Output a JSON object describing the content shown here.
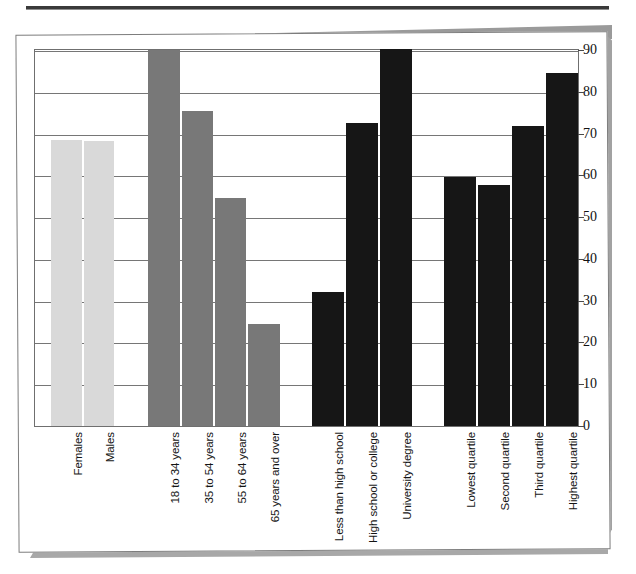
{
  "chart_data": {
    "type": "bar",
    "title": "",
    "subtitle": "",
    "xlabel": "",
    "ylabel": "",
    "ylim": [
      0,
      90
    ],
    "y_ticks": [
      0,
      10,
      20,
      30,
      40,
      50,
      60,
      70,
      80,
      90
    ],
    "grid": true,
    "legend": "none",
    "orientation": "vertical",
    "groups": [
      {
        "name": "Sex",
        "color": "#d9d9d9",
        "categories": [
          "Females",
          "Males"
        ],
        "values": [
          68.5,
          68.3
        ]
      },
      {
        "name": "Age group",
        "color": "#787878",
        "categories": [
          "18 to 34 years",
          "35 to 54 years",
          "55 to 64 years",
          "65 years and over"
        ],
        "values": [
          90.0,
          75.3,
          54.5,
          24.5
        ]
      },
      {
        "name": "Education",
        "color": "#161616",
        "categories": [
          "Less than high school",
          "High school or college",
          "University degree"
        ],
        "values": [
          32.0,
          72.5,
          90.3
        ]
      },
      {
        "name": "Income quartile",
        "color": "#161616",
        "categories": [
          "Lowest quartile",
          "Second quartile",
          "Third quartile",
          "Highest quartile"
        ],
        "values": [
          59.5,
          57.8,
          71.8,
          84.5
        ]
      }
    ],
    "categories": [
      "Females",
      "Males",
      "18 to 34 years",
      "35 to 54 years",
      "55 to 64 years",
      "65 years and over",
      "Less than high school",
      "High school or college",
      "University degree",
      "Lowest quartile",
      "Second quartile",
      "Third quartile",
      "Highest quartile"
    ],
    "values": [
      68.5,
      68.3,
      90.0,
      75.3,
      54.5,
      24.5,
      32.0,
      72.5,
      90.3,
      59.5,
      57.8,
      71.8,
      84.5
    ]
  },
  "bars": [
    {
      "label": "Females",
      "value": 68.5,
      "color": "#d9d9d9",
      "x": 17,
      "w": 31
    },
    {
      "label": "Males",
      "value": 68.3,
      "color": "#d9d9d9",
      "x": 50,
      "w": 30
    },
    {
      "label": "18 to 34 years",
      "value": 90.0,
      "color": "#787878",
      "x": 114,
      "w": 32
    },
    {
      "label": "35 to 54 years",
      "value": 75.3,
      "color": "#787878",
      "x": 148,
      "w": 31
    },
    {
      "label": "55 to 64 years",
      "value": 54.5,
      "color": "#787878",
      "x": 181,
      "w": 31
    },
    {
      "label": "65 years and over",
      "value": 24.5,
      "color": "#787878",
      "x": 214,
      "w": 32
    },
    {
      "label": "Less than high school",
      "value": 32.0,
      "color": "#161616",
      "x": 278,
      "w": 32
    },
    {
      "label": "High school or college",
      "value": 72.5,
      "color": "#161616",
      "x": 312,
      "w": 32
    },
    {
      "label": "University degree",
      "value": 90.3,
      "color": "#161616",
      "x": 346,
      "w": 32
    },
    {
      "label": "Lowest quartile",
      "value": 59.5,
      "color": "#161616",
      "x": 410,
      "w": 32
    },
    {
      "label": "Second quartile",
      "value": 57.8,
      "color": "#161616",
      "x": 444,
      "w": 32
    },
    {
      "label": "Third quartile",
      "value": 71.8,
      "color": "#161616",
      "x": 478,
      "w": 32
    },
    {
      "label": "Highest quartile",
      "value": 84.5,
      "color": "#161616",
      "x": 512,
      "w": 32
    }
  ],
  "axis": {
    "tick_labels": [
      "90",
      "80",
      "70",
      "60",
      "50",
      "40",
      "30",
      "20",
      "10",
      "0"
    ],
    "max": 90,
    "min": 0
  },
  "colors": {
    "light_gray_bar": "#d9d9d9",
    "medium_gray_bar": "#787878",
    "black_bar": "#161616",
    "gridline": "#767676",
    "card_border": "#7d7d7d",
    "page_background": "#ffffff",
    "shadow": "#9e9e9e",
    "top_rule": "#3a3a3a"
  }
}
